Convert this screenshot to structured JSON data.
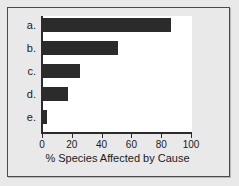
{
  "chart_data": {
    "type": "bar",
    "orientation": "horizontal",
    "title": "",
    "xlabel": "% Species Affected by Cause",
    "ylabel": "",
    "categories": [
      "a.",
      "b.",
      "c.",
      "d.",
      "e."
    ],
    "values": [
      86,
      50,
      25,
      17,
      3
    ],
    "xlim": [
      0,
      100
    ],
    "xticks": [
      0,
      20,
      40,
      60,
      80,
      100
    ],
    "xtick_labels": [
      "0",
      "20",
      "40",
      "60",
      "80",
      "100"
    ],
    "grid": false,
    "legend": false,
    "bar_color": "#2b2b2b",
    "plot_background": "#ffffff",
    "figure_background": "#e9e9e9",
    "axis_color": "#2b2b2b"
  }
}
